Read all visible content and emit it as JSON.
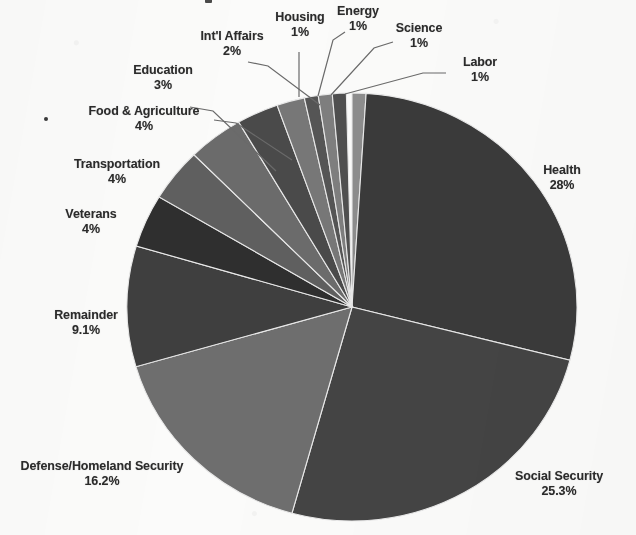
{
  "chart_data": {
    "type": "pie",
    "title": "",
    "xlabel": "",
    "ylabel": "",
    "legend_position": "none",
    "grid": false,
    "labels_outside": true,
    "total_percent": 99.6,
    "categories": [
      "Labor",
      "Health",
      "Social Security",
      "Defense/Homeland Security",
      "Remainder",
      "Veterans",
      "Transportation",
      "Food & Agriculture",
      "Education",
      "Int'l Affairs",
      "Housing",
      "Energy",
      "Science"
    ],
    "values": [
      1,
      28,
      25.3,
      16.2,
      9.1,
      4,
      4,
      4,
      3,
      2,
      1,
      1,
      1
    ],
    "value_labels": [
      "1%",
      "28%",
      "25.3%",
      "16.2%",
      "9.1%",
      "4%",
      "4%",
      "4%",
      "3%",
      "2%",
      "1%",
      "1%",
      "1%"
    ],
    "colors": [
      "#8d8d8d",
      "#3a3a3a",
      "#444444",
      "#6e6e6e",
      "#3f3f3f",
      "#2f2f2f",
      "#5f5f5f",
      "#6b6b6b",
      "#4a4a4a",
      "#777777",
      "#555555",
      "#7e7e7e",
      "#4f4f4f"
    ],
    "slices": [
      {
        "name": "Labor",
        "percent": 1,
        "label": "Labor",
        "value_label": "1%",
        "color": "#8d8d8d",
        "start_deg": 0,
        "end_deg": 3.6
      },
      {
        "name": "Health",
        "percent": 28,
        "label": "Health",
        "value_label": "28%",
        "color": "#3a3a3a",
        "start_deg": 3.6,
        "end_deg": 104.4
      },
      {
        "name": "Social Security",
        "percent": 25.3,
        "label": "Social Security",
        "value_label": "25.3%",
        "color": "#444444",
        "start_deg": 104.4,
        "end_deg": 195.48
      },
      {
        "name": "Defense/Homeland Security",
        "percent": 16.2,
        "label": "Defense/Homeland Security",
        "value_label": "16.2%",
        "color": "#6e6e6e",
        "start_deg": 195.48,
        "end_deg": 253.8
      },
      {
        "name": "Remainder",
        "percent": 9.1,
        "label": "Remainder",
        "value_label": "9.1%",
        "color": "#3f3f3f",
        "start_deg": 253.8,
        "end_deg": 286.56
      },
      {
        "name": "Veterans",
        "percent": 4,
        "label": "Veterans",
        "value_label": "4%",
        "color": "#2f2f2f",
        "start_deg": 286.56,
        "end_deg": 300.96
      },
      {
        "name": "Transportation",
        "percent": 4,
        "label": "Transportation",
        "value_label": "4%",
        "color": "#5f5f5f",
        "start_deg": 300.96,
        "end_deg": 315.36
      },
      {
        "name": "Food & Agriculture",
        "percent": 4,
        "label": "Food & Agriculture",
        "value_label": "4%",
        "color": "#6b6b6b",
        "start_deg": 315.36,
        "end_deg": 329.76
      },
      {
        "name": "Education",
        "percent": 3,
        "label": "Education",
        "value_label": "3%",
        "color": "#4a4a4a",
        "start_deg": 329.76,
        "end_deg": 340.56
      },
      {
        "name": "Int'l Affairs",
        "percent": 2,
        "label": "Int'l Affairs",
        "value_label": "2%",
        "color": "#777777",
        "start_deg": 340.56,
        "end_deg": 347.76
      },
      {
        "name": "Housing",
        "percent": 1,
        "label": "Housing",
        "value_label": "1%",
        "color": "#555555",
        "start_deg": 347.76,
        "end_deg": 351.36
      },
      {
        "name": "Energy",
        "percent": 1,
        "label": "Energy",
        "value_label": "1%",
        "color": "#7e7e7e",
        "start_deg": 351.36,
        "end_deg": 354.96
      },
      {
        "name": "Science",
        "percent": 1,
        "label": "Science",
        "value_label": "1%",
        "color": "#4f4f4f",
        "start_deg": 354.96,
        "end_deg": 358.56
      }
    ]
  },
  "labels": {
    "housing": {
      "name": "Housing",
      "pct": "1%"
    },
    "energy": {
      "name": "Energy",
      "pct": "1%"
    },
    "science": {
      "name": "Science",
      "pct": "1%"
    },
    "labor": {
      "name": "Labor",
      "pct": "1%"
    },
    "intl": {
      "name": "Int'l Affairs",
      "pct": "2%"
    },
    "education": {
      "name": "Education",
      "pct": "3%"
    },
    "foodag": {
      "name": "Food & Agriculture",
      "pct": "4%"
    },
    "transport": {
      "name": "Transportation",
      "pct": "4%"
    },
    "veterans": {
      "name": "Veterans",
      "pct": "4%"
    },
    "remainder": {
      "name": "Remainder",
      "pct": "9.1%"
    },
    "defense": {
      "name": "Defense/Homeland Security",
      "pct": "16.2%"
    },
    "health": {
      "name": "Health",
      "pct": "28%"
    },
    "socialsec": {
      "name": "Social Security",
      "pct": "25.3%"
    }
  },
  "style": {
    "background": "#fbfbfa",
    "text_color": "#2b2b2b",
    "leader_line_color": "#6a6a6a",
    "slice_outline": "#e9e9e9"
  },
  "geometry": {
    "center_x": 352,
    "center_y": 307,
    "radius_x": 225,
    "radius_y": 214
  }
}
